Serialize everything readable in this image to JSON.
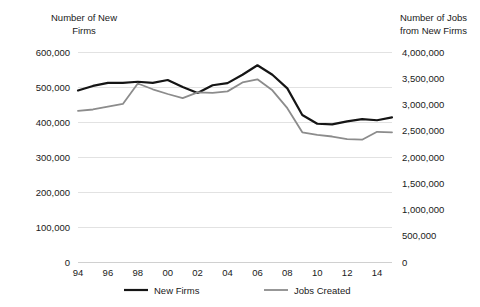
{
  "chart_data": {
    "type": "line",
    "title": "",
    "xlabel": "",
    "grid": true,
    "legend_position": "bottom",
    "x": [
      1994,
      1995,
      1996,
      1997,
      1998,
      1999,
      2000,
      2001,
      2002,
      2003,
      2004,
      2005,
      2006,
      2007,
      2008,
      2009,
      2010,
      2011,
      2012,
      2013,
      2014,
      2015
    ],
    "xtick_labels": [
      "94",
      "96",
      "98",
      "00",
      "02",
      "04",
      "06",
      "08",
      "10",
      "12",
      "14"
    ],
    "xtick_values": [
      1994,
      1996,
      1998,
      2000,
      2002,
      2004,
      2006,
      2008,
      2010,
      2012,
      2014
    ],
    "axes": {
      "left": {
        "label": "Number of New Firms",
        "label_line1": "Number of New",
        "label_line2": "Firms",
        "ylim": [
          0,
          600000
        ],
        "ticks": [
          0,
          100000,
          200000,
          300000,
          400000,
          500000,
          600000
        ],
        "tick_labels": [
          "0",
          "100,000",
          "200,000",
          "300,000",
          "400,000",
          "500,000",
          "600,000"
        ]
      },
      "right": {
        "label": "Number of Jobs from New Firms",
        "label_line1": "Number of Jobs",
        "label_line2": "from New Firms",
        "ylim": [
          0,
          4000000
        ],
        "ticks": [
          0,
          500000,
          1000000,
          1500000,
          2000000,
          2500000,
          3000000,
          3500000,
          4000000
        ],
        "tick_labels": [
          "0",
          "500,000",
          "1,000,000",
          "1,500,000",
          "2,000,000",
          "2,500,000",
          "3,000,000",
          "3,500,000",
          "4,000,000"
        ]
      }
    },
    "series": [
      {
        "name": "New Firms",
        "axis": "left",
        "color": "#151515",
        "width": 2.2,
        "values": [
          490000,
          503000,
          512000,
          512000,
          515000,
          512000,
          520000,
          500000,
          483000,
          505000,
          511000,
          535000,
          562000,
          535000,
          496000,
          420000,
          395000,
          393000,
          402000,
          408000,
          405000,
          413000
        ]
      },
      {
        "name": "Jobs Created",
        "axis": "right",
        "color": "#8c8c8c",
        "width": 1.8,
        "values": [
          2880000,
          2905000,
          2960000,
          3010000,
          3400000,
          3290000,
          3200000,
          3120000,
          3230000,
          3220000,
          3250000,
          3420000,
          3480000,
          3270000,
          2930000,
          2470000,
          2420000,
          2390000,
          2340000,
          2330000,
          2480000,
          2470000
        ]
      }
    ]
  },
  "legend": {
    "items": [
      {
        "label": "New Firms",
        "color": "#151515",
        "width": 2.2
      },
      {
        "label": "Jobs Created",
        "color": "#8c8c8c",
        "width": 1.8
      }
    ]
  }
}
